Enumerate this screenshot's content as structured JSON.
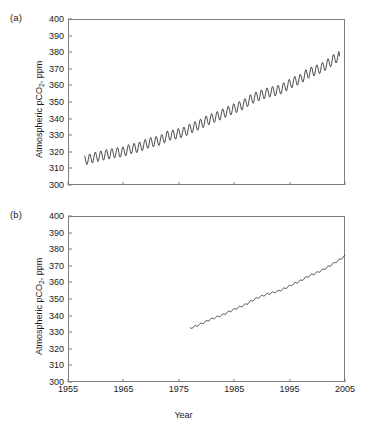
{
  "figure": {
    "xlabel": "Year",
    "ylabel_main": "Atmospheric pCO",
    "ylabel_sub": "2",
    "ylabel_tail": ", ppm",
    "panel_a_label": "(a)",
    "panel_b_label": "(b)",
    "axis_color": "#7d7d7d",
    "line_color": "#1a1a1a"
  },
  "chart_data": [
    {
      "type": "line",
      "panel": "(a)",
      "title": "",
      "xlabel": "Year",
      "ylabel": "Atmospheric pCO2, ppm",
      "xlim": [
        1955,
        2005
      ],
      "ylim": [
        300,
        400
      ],
      "xticks": [
        1955,
        1965,
        1975,
        1985,
        1995,
        2005
      ],
      "yticks": [
        300,
        310,
        320,
        330,
        340,
        350,
        360,
        370,
        380,
        390,
        400
      ],
      "grid": false,
      "legend": null,
      "description": "Monthly atmospheric CO2 with strong seasonal sawtooth cycle superimposed on rising trend",
      "seasonal_amplitude_ppm": 6.0,
      "series": [
        {
          "name": "Atmospheric pCO2 (seasonal record)",
          "x": [
            1958.0,
            1959.0,
            1960.0,
            1961.0,
            1962.0,
            1963.0,
            1964.0,
            1965.0,
            1966.0,
            1967.0,
            1968.0,
            1969.0,
            1970.0,
            1971.0,
            1972.0,
            1973.0,
            1974.0,
            1975.0,
            1976.0,
            1977.0,
            1978.0,
            1979.0,
            1980.0,
            1981.0,
            1982.0,
            1983.0,
            1984.0,
            1985.0,
            1986.0,
            1987.0,
            1988.0,
            1989.0,
            1990.0,
            1991.0,
            1992.0,
            1993.0,
            1994.0,
            1995.0,
            1996.0,
            1997.0,
            1998.0,
            1999.0,
            2000.0,
            2001.0,
            2002.0,
            2003.0,
            2004.0
          ],
          "values": [
            315.0,
            315.8,
            316.9,
            317.6,
            318.4,
            319.0,
            319.6,
            320.0,
            321.4,
            322.2,
            323.0,
            324.6,
            325.7,
            326.3,
            327.5,
            329.7,
            330.2,
            331.1,
            332.0,
            333.8,
            335.4,
            336.8,
            338.7,
            340.1,
            341.4,
            343.0,
            344.6,
            346.0,
            347.4,
            349.2,
            351.6,
            353.1,
            354.4,
            355.6,
            356.4,
            357.1,
            358.8,
            360.8,
            362.6,
            363.8,
            366.6,
            368.3,
            369.5,
            371.0,
            373.2,
            375.8,
            377.5
          ]
        }
      ]
    },
    {
      "type": "line",
      "panel": "(b)",
      "title": "",
      "xlabel": "Year",
      "ylabel": "Atmospheric pCO2, ppm",
      "xlim": [
        1955,
        2005
      ],
      "ylim": [
        300,
        400
      ],
      "xticks": [
        1955,
        1965,
        1975,
        1985,
        1995,
        2005
      ],
      "yticks": [
        300,
        310,
        320,
        330,
        340,
        350,
        360,
        370,
        380,
        390,
        400
      ],
      "grid": false,
      "legend": null,
      "description": "Atmospheric CO2 record with very weak seasonal signal, near-linear rise from late 1970s",
      "seasonal_amplitude_ppm": 1.0,
      "series": [
        {
          "name": "Atmospheric pCO2 (low-amplitude record)",
          "x": [
            1977.0,
            1978.0,
            1979.0,
            1980.0,
            1981.0,
            1982.0,
            1983.0,
            1984.0,
            1985.0,
            1986.0,
            1987.0,
            1988.0,
            1989.0,
            1990.0,
            1991.0,
            1992.0,
            1993.0,
            1994.0,
            1995.0,
            1996.0,
            1997.0,
            1998.0,
            1999.0,
            2000.0,
            2001.0,
            2002.0,
            2003.0,
            2004.0,
            2005.0
          ],
          "values": [
            332.3,
            333.6,
            335.0,
            336.6,
            338.1,
            339.3,
            340.6,
            342.2,
            343.8,
            345.2,
            346.6,
            348.6,
            350.4,
            351.8,
            353.0,
            353.9,
            354.8,
            356.2,
            357.8,
            359.6,
            361.0,
            363.0,
            364.6,
            366.0,
            367.6,
            369.4,
            371.6,
            373.6,
            376.0
          ]
        }
      ]
    }
  ]
}
